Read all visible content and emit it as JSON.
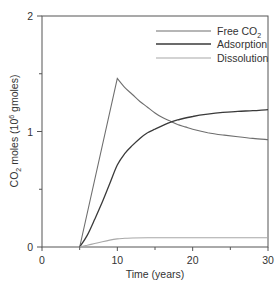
{
  "chart_data": {
    "type": "line",
    "title": "",
    "xlabel": "Time (years)",
    "ylabel": "CO2 moles (10^6 gmoles)",
    "ylabel_parts": {
      "pre": "CO",
      "sub": "2",
      "mid": " moles (10",
      "sup": "6",
      "post": " gmoles)"
    },
    "xlim": [
      0,
      30
    ],
    "ylim": [
      0,
      2
    ],
    "x_ticks_major": [
      0,
      10,
      20,
      30
    ],
    "x_ticks_minor": [
      5,
      15,
      25
    ],
    "y_ticks_major": [
      0,
      1,
      2
    ],
    "y_ticks_minor": [
      0.5,
      1.5
    ],
    "grid": false,
    "legend_position": "upper right",
    "series": [
      {
        "name": "Free CO2",
        "label_parts": {
          "pre": "Free CO",
          "sub": "2"
        },
        "color": "#6e6e6e",
        "width": 1.1,
        "x": [
          5,
          10,
          11,
          12,
          13,
          14,
          15,
          16,
          17,
          18,
          19,
          20,
          22,
          24,
          26,
          28,
          30
        ],
        "y": [
          0,
          1.46,
          1.38,
          1.32,
          1.26,
          1.21,
          1.16,
          1.12,
          1.09,
          1.06,
          1.04,
          1.02,
          0.99,
          0.97,
          0.955,
          0.94,
          0.93
        ]
      },
      {
        "name": "Adsorption",
        "label_parts": {
          "pre": "Adsorption",
          "sub": ""
        },
        "color": "#3a3a3a",
        "width": 1.3,
        "x": [
          5,
          6,
          7,
          8,
          9,
          10,
          11,
          12,
          13,
          14,
          15,
          16,
          17,
          18,
          20,
          22,
          24,
          26,
          28,
          30
        ],
        "y": [
          0,
          0.1,
          0.24,
          0.39,
          0.55,
          0.71,
          0.81,
          0.88,
          0.94,
          0.99,
          1.02,
          1.05,
          1.08,
          1.1,
          1.13,
          1.15,
          1.165,
          1.175,
          1.18,
          1.19
        ]
      },
      {
        "name": "Dissolution",
        "label_parts": {
          "pre": "Dissolution",
          "sub": ""
        },
        "color": "#a8a8a8",
        "width": 1.1,
        "x": [
          5,
          6,
          7,
          8,
          9,
          10,
          11,
          12,
          14,
          16,
          20,
          25,
          30
        ],
        "y": [
          0,
          0.015,
          0.03,
          0.045,
          0.06,
          0.07,
          0.075,
          0.078,
          0.08,
          0.08,
          0.08,
          0.08,
          0.08
        ]
      }
    ]
  }
}
